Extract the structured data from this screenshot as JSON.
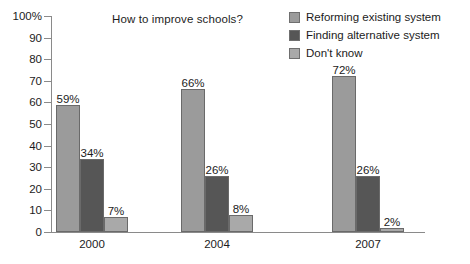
{
  "chart_data": {
    "type": "bar",
    "title": "How to improve schools?",
    "xlabel": "",
    "ylabel": "",
    "ylim": [
      0,
      100
    ],
    "yticks": [
      "0",
      "10",
      "20",
      "30",
      "40",
      "50",
      "60",
      "70",
      "80",
      "90",
      "100%"
    ],
    "grid": false,
    "legend_position": "top-right",
    "categories": [
      "2000",
      "2004",
      "2007"
    ],
    "series": [
      {
        "name": "Reforming existing system",
        "color": "#9b9b9b",
        "values": [
          59,
          66,
          72
        ],
        "labels": [
          "59%",
          "66%",
          "72%"
        ]
      },
      {
        "name": "Finding alternative system",
        "color": "#565656",
        "values": [
          34,
          26,
          26
        ],
        "labels": [
          "34%",
          "26%",
          "26%"
        ]
      },
      {
        "name": "Don't know",
        "color": "#a9a9a9",
        "values": [
          7,
          8,
          2
        ],
        "labels": [
          "7%",
          "8%",
          "2%"
        ]
      }
    ]
  },
  "axis": {
    "y_tick_labels": [
      "100%",
      "90",
      "80",
      "70",
      "60",
      "50",
      "40",
      "30",
      "20",
      "10",
      "0"
    ],
    "x_tick_labels": [
      "2000",
      "2004",
      "2007"
    ]
  },
  "legend": {
    "items": [
      {
        "label": "Reforming existing system",
        "color": "#9b9b9b"
      },
      {
        "label": "Finding alternative system",
        "color": "#565656"
      },
      {
        "label": "Don't know",
        "color": "#a9a9a9"
      }
    ]
  }
}
